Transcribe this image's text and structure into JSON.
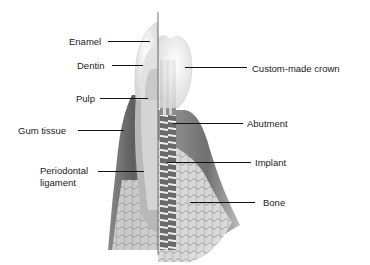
{
  "diagram": {
    "left_side": "natural tooth",
    "right_side": "dental implant",
    "labels": {
      "enamel": "Enamel",
      "dentin": "Dentin",
      "pulp": "Pulp",
      "gum_tissue": "Gum tissue",
      "periodontal_ligament_1": "Periodontal",
      "periodontal_ligament_2": "ligament",
      "custom_crown": "Custom-made crown",
      "abutment": "Abutment",
      "implant": "Implant",
      "bone": "Bone"
    },
    "colors": {
      "background": "#ffffff",
      "text": "#222222",
      "leader_line": "#111111",
      "tissue_dark": "#6f6f6f",
      "tissue_light": "#cfcfcf",
      "crown": "#f2f2f2"
    }
  }
}
